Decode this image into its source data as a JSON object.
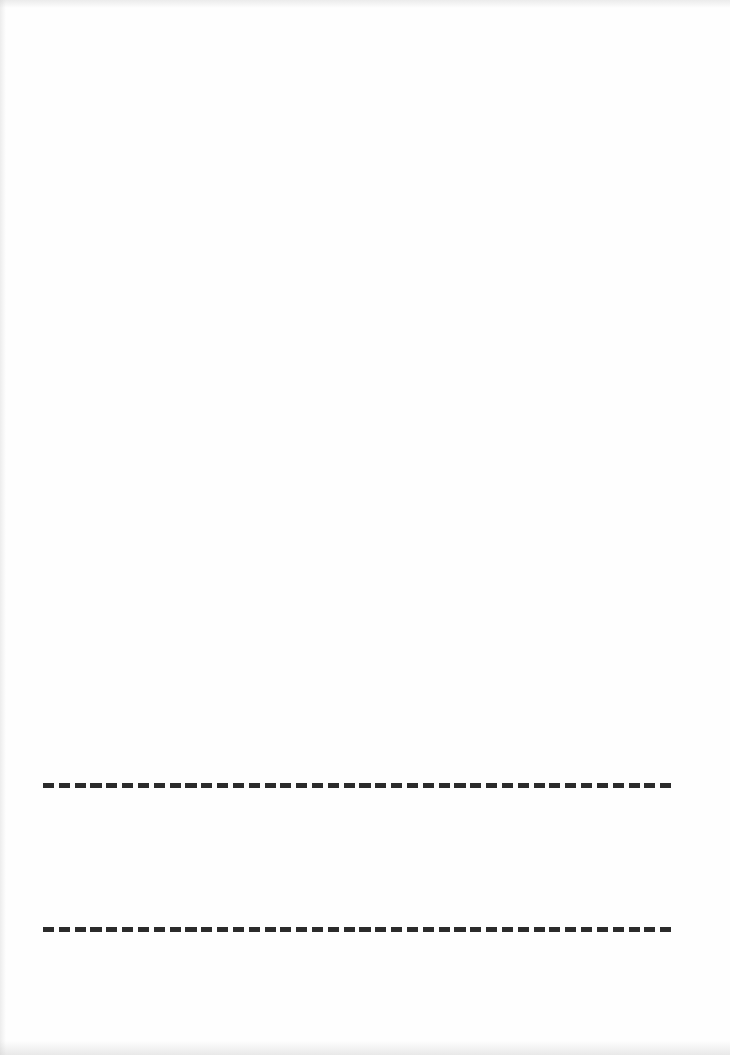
{
  "document": {
    "background_color": "#fefefe",
    "lines": [
      {
        "id": "dashed-line-1",
        "style": "dashed",
        "color": "#2b2b2b",
        "x_start": 43,
        "x_end": 676,
        "y": 783,
        "thickness": 5,
        "dash_count": 40
      },
      {
        "id": "dashed-line-2",
        "style": "dashed",
        "color": "#2b2b2b",
        "x_start": 43,
        "x_end": 676,
        "y": 927,
        "thickness": 5,
        "dash_count": 40
      }
    ]
  }
}
